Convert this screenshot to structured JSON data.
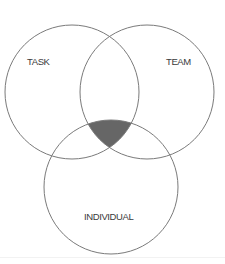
{
  "diagram": {
    "type": "venn",
    "circles": [
      {
        "id": "task",
        "label": "TASK",
        "cx": 72,
        "cy": 92,
        "r": 67
      },
      {
        "id": "team",
        "label": "TEAM",
        "cx": 147,
        "cy": 92,
        "r": 67
      },
      {
        "id": "individual",
        "label": "INDIVIDUAL",
        "cx": 111,
        "cy": 187,
        "r": 67
      }
    ],
    "shaded_region": "intersection of TASK, TEAM and INDIVIDUAL",
    "colors": {
      "stroke": "#7a7a7a",
      "overlap_fill": "#666666",
      "label_text": "#3a3a3a",
      "background": "#ffffff"
    }
  }
}
